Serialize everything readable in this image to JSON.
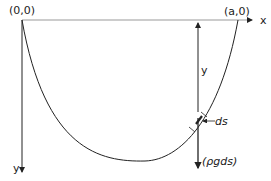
{
  "diagram": {
    "labels": {
      "origin": "(0,0)",
      "right_end": "(a,0)",
      "x_axis": "x",
      "y_axis": "y",
      "depth": "y",
      "element": "ds",
      "force": "(ρgds)"
    },
    "colors": {
      "ink": "#222222",
      "axis": "#999999",
      "background": "#ffffff"
    }
  }
}
